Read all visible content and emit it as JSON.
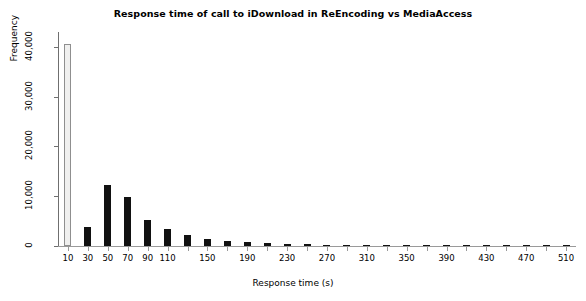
{
  "chart_data": {
    "type": "bar",
    "title": "Response time of call to iDownload in ReEncoding vs MediaAccess",
    "xlabel": "Response time (s)",
    "ylabel": "Frequency",
    "grid": false,
    "legend": null,
    "xlim": [
      0,
      520
    ],
    "ylim": [
      0,
      43000
    ],
    "ytick_labels": [
      "0",
      "10,000",
      "20,000",
      "30,000",
      "40,000"
    ],
    "ytick_values": [
      0,
      10000,
      20000,
      30000,
      40000
    ],
    "xtick_labels": [
      "10",
      "30",
      "50",
      "70",
      "90",
      "110",
      "150",
      "190",
      "230",
      "270",
      "310",
      "350",
      "390",
      "430",
      "470",
      "510"
    ],
    "xtick_values": [
      10,
      30,
      50,
      70,
      90,
      110,
      150,
      190,
      230,
      270,
      310,
      350,
      390,
      430,
      470,
      510
    ],
    "bin_width": 20,
    "categories": [
      10,
      30,
      50,
      70,
      90,
      110,
      130,
      150,
      170,
      190,
      210,
      230,
      250,
      270,
      290,
      310,
      330,
      350,
      370,
      390,
      410,
      430,
      450,
      470,
      490,
      510
    ],
    "values": [
      40600,
      3900,
      12300,
      9800,
      5200,
      3400,
      2200,
      1500,
      1100,
      800,
      600,
      450,
      350,
      250,
      200,
      160,
      130,
      110,
      90,
      80,
      70,
      60,
      50,
      45,
      40,
      35
    ],
    "first_bar_style": "light-outlined",
    "bar_color": "#111111",
    "first_bar_color": "#f0f0ef"
  }
}
